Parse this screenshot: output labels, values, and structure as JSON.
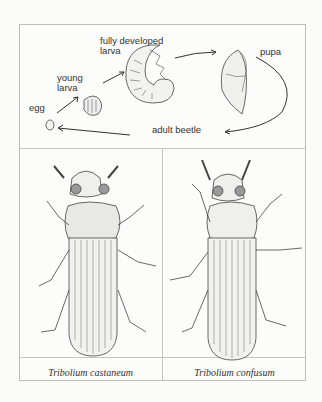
{
  "lifecycle": {
    "stages": {
      "egg": "egg",
      "young_larva": "young\nlarva",
      "fully_developed_larva": "fully developed\nlarva",
      "pupa": "pupa",
      "adult_beetle": "adult beetle"
    }
  },
  "species": [
    {
      "name": "Tribolium castaneum"
    },
    {
      "name": "Tribolium confusum"
    }
  ]
}
